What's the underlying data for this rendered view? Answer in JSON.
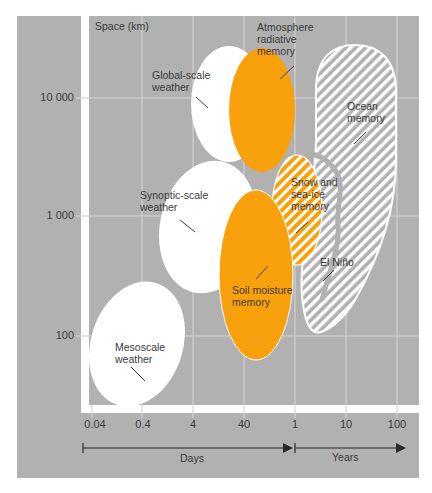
{
  "colors": {
    "background": "#B1B1B1",
    "grid": "#D6D6D6",
    "white_shape": "#FFFFFF",
    "orange": "#F9A10C",
    "text": "#3A3A3A"
  },
  "axes": {
    "y_title": "Space (km)",
    "y_ticks": [
      "10 000",
      "1 000",
      "100"
    ],
    "x_ticks": [
      "0.04",
      "0.4",
      "4",
      "40",
      "1",
      "10",
      "100"
    ],
    "x_units": [
      {
        "label": "Days"
      },
      {
        "label": "Years"
      }
    ]
  },
  "regions": [
    {
      "id": "mesoscale",
      "label_lines": [
        "Mesoscale",
        "weather"
      ],
      "fill": "white"
    },
    {
      "id": "synoptic",
      "label_lines": [
        "Synoptic-scale",
        "weather"
      ],
      "fill": "white"
    },
    {
      "id": "global",
      "label_lines": [
        "Global-scale",
        "weather"
      ],
      "fill": "white"
    },
    {
      "id": "atmosphere",
      "label_lines": [
        "Atmosphere",
        "radiative",
        "memory"
      ],
      "fill": "orange"
    },
    {
      "id": "soil",
      "label_lines": [
        "Soil moisture",
        "memory"
      ],
      "fill": "orange"
    },
    {
      "id": "snow",
      "label_lines": [
        "Snow and",
        "sea-ice",
        "memory"
      ],
      "fill": "orange-hatched"
    },
    {
      "id": "ocean",
      "label_lines": [
        "Ocean",
        "memory"
      ],
      "fill": "white-hatched"
    },
    {
      "id": "elnino",
      "label_lines": [
        "El Niño"
      ],
      "fill": "white-hatched"
    }
  ]
}
